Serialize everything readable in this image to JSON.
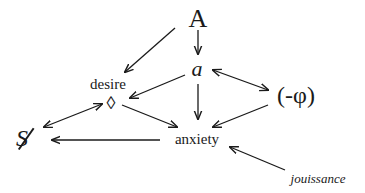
{
  "diagram": {
    "type": "graph-of-concepts",
    "nodes": {
      "A": {
        "label": "A"
      },
      "a": {
        "label": "a"
      },
      "desire": {
        "label": "desire"
      },
      "diamond": {
        "label": "◊"
      },
      "phi": {
        "label": "(-φ)"
      },
      "S": {
        "label": "S"
      },
      "anxiety": {
        "label": "anxiety"
      },
      "jouissance": {
        "label": "jouissance"
      }
    },
    "edges": [
      {
        "from": "A",
        "to": "desire",
        "direction": "forward"
      },
      {
        "from": "A",
        "to": "a",
        "direction": "forward"
      },
      {
        "from": "a",
        "to": "desire",
        "direction": "forward"
      },
      {
        "from": "a",
        "to": "(-φ)",
        "direction": "bidirectional"
      },
      {
        "from": "a",
        "to": "anxiety",
        "direction": "forward"
      },
      {
        "from": "◊",
        "to": "anxiety",
        "direction": "forward"
      },
      {
        "from": "(-φ)",
        "to": "anxiety",
        "direction": "forward"
      },
      {
        "from": "◊",
        "to": "S (barred)",
        "direction": "bidirectional"
      },
      {
        "from": "anxiety",
        "to": "S (barred)",
        "direction": "forward"
      },
      {
        "from": "jouissance",
        "to": "anxiety",
        "direction": "forward"
      }
    ],
    "colors": {
      "ink": "#1a1a1a",
      "background": "#ffffff"
    }
  }
}
